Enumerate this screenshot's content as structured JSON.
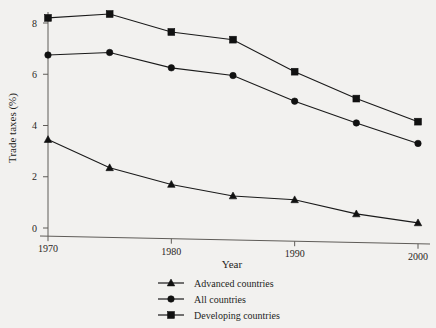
{
  "chart_data": {
    "type": "line",
    "title": "",
    "xlabel": "Year",
    "ylabel": "Trade taxes (%)",
    "x": [
      1970,
      1975,
      1980,
      1985,
      1990,
      1995,
      2000
    ],
    "xlim": [
      1970,
      2000
    ],
    "ylim": [
      0,
      8.6
    ],
    "xticks": [
      1970,
      1980,
      1990,
      2000
    ],
    "xtick_labels": [
      "1970",
      "1980",
      "1990",
      "2000"
    ],
    "yticks": [
      0,
      2,
      4,
      6,
      8
    ],
    "ytick_labels": [
      "0",
      "2",
      "4",
      "6",
      "8"
    ],
    "grid": false,
    "legend_position": "below",
    "series": [
      {
        "name": "Advanced countries",
        "marker": "triangle",
        "color": "#111111",
        "values": [
          3.45,
          2.35,
          1.7,
          1.25,
          1.1,
          0.55,
          0.2
        ]
      },
      {
        "name": "All countries",
        "marker": "circle",
        "color": "#111111",
        "values": [
          6.75,
          6.85,
          6.25,
          5.95,
          4.95,
          4.1,
          3.3
        ]
      },
      {
        "name": "Developing countries",
        "marker": "square",
        "color": "#111111",
        "values": [
          8.2,
          8.35,
          7.65,
          7.35,
          6.1,
          5.05,
          4.15
        ]
      }
    ]
  },
  "legend": {
    "items": [
      {
        "label": "Advanced countries",
        "marker": "triangle-marker-icon"
      },
      {
        "label": "All countries",
        "marker": "circle-marker-icon"
      },
      {
        "label": "Developing countries",
        "marker": "square-marker-icon"
      }
    ]
  }
}
